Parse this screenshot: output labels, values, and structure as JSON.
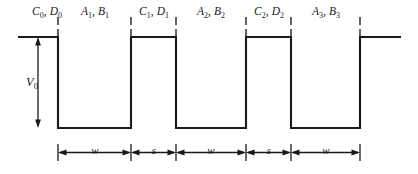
{
  "figure": {
    "kind": "periodic-square-well-potential-diagram",
    "colors": {
      "stroke": "#1a1a1a",
      "background": "#ffffff",
      "tick": "#3a3a3a"
    },
    "region_labels": [
      {
        "id": "region-0",
        "coeffs": "C₀, D₀",
        "first": "C",
        "first_sub": "0",
        "second": "D",
        "second_sub": "0",
        "cx": 47,
        "y": 6
      },
      {
        "id": "region-1",
        "coeffs": "A₁, B₁",
        "first": "A",
        "first_sub": "1",
        "second": "B",
        "second_sub": "1",
        "cx": 95,
        "y": 6
      },
      {
        "id": "region-2",
        "coeffs": "C₁, D₁",
        "first": "C",
        "first_sub": "1",
        "second": "D",
        "second_sub": "1",
        "cx": 154,
        "y": 6
      },
      {
        "id": "region-3",
        "coeffs": "A₂, B₂",
        "first": "A",
        "first_sub": "2",
        "second": "B",
        "second_sub": "2",
        "cx": 211,
        "y": 6
      },
      {
        "id": "region-4",
        "coeffs": "C₂, D₂",
        "first": "C",
        "first_sub": "2",
        "second": "D",
        "second_sub": "2",
        "cx": 269,
        "y": 6
      },
      {
        "id": "region-5",
        "coeffs": "A₃, B₃",
        "first": "A",
        "first_sub": "3",
        "second": "B",
        "second_sub": "3",
        "cx": 326,
        "y": 6
      }
    ],
    "depth_label": {
      "text": "V",
      "sub": "0",
      "x": 26,
      "y": 76
    },
    "dimension_labels": [
      {
        "id": "dim-w-1",
        "text": "w",
        "cx": 95,
        "y": 145
      },
      {
        "id": "dim-s-1",
        "text": "s",
        "cx": 154,
        "y": 145
      },
      {
        "id": "dim-w-2",
        "text": "w",
        "cx": 211,
        "y": 145
      },
      {
        "id": "dim-s-2",
        "text": "s",
        "cx": 269,
        "y": 145
      },
      {
        "id": "dim-w-3",
        "text": "w",
        "cx": 326,
        "y": 145
      }
    ],
    "geometry": {
      "top_y": 37,
      "bottom_y": 128,
      "left_x": 18,
      "right_x": 401,
      "edges": [
        58,
        131,
        176,
        246,
        291,
        360
      ],
      "tick_top_y": 18,
      "dim_line_y": 152
    }
  }
}
